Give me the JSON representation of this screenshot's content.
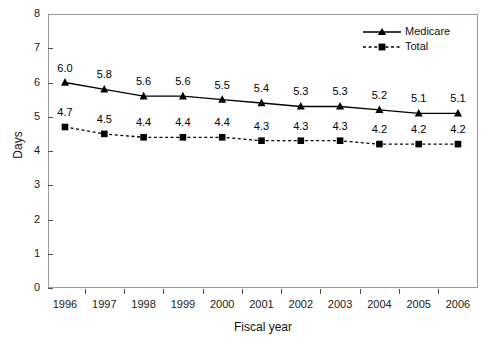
{
  "chart_data": {
    "type": "line",
    "title": "",
    "subtitle": "",
    "xlabel": "Fiscal year",
    "ylabel": "Days",
    "categories": [
      "1996",
      "1997",
      "1998",
      "1999",
      "2000",
      "2001",
      "2002",
      "2003",
      "2004",
      "2005",
      "2006"
    ],
    "x": [
      1996,
      1997,
      1998,
      1999,
      2000,
      2001,
      2002,
      2003,
      2004,
      2005,
      2006
    ],
    "ylim": [
      0,
      8
    ],
    "yticks": [
      "0",
      "1",
      "2",
      "3",
      "4",
      "5",
      "6",
      "7",
      "8"
    ],
    "grid": false,
    "legend_position": "top-right",
    "series": [
      {
        "name": "Medicare",
        "marker": "triangle",
        "linestyle": "solid",
        "color": "#000000",
        "values": [
          6.0,
          5.8,
          5.6,
          5.6,
          5.5,
          5.4,
          5.3,
          5.3,
          5.2,
          5.1,
          5.1
        ],
        "labels": [
          "6.0",
          "5.8",
          "5.6",
          "5.6",
          "5.5",
          "5.4",
          "5.3",
          "5.3",
          "5.2",
          "5.1",
          "5.1"
        ]
      },
      {
        "name": "Total",
        "marker": "square",
        "linestyle": "dashed",
        "color": "#000000",
        "values": [
          4.7,
          4.5,
          4.4,
          4.4,
          4.4,
          4.3,
          4.3,
          4.3,
          4.2,
          4.2,
          4.2
        ],
        "labels": [
          "4.7",
          "4.5",
          "4.4",
          "4.4",
          "4.4",
          "4.3",
          "4.3",
          "4.3",
          "4.2",
          "4.2",
          "4.2"
        ]
      }
    ]
  },
  "legend": {
    "items": [
      {
        "label": "Medicare"
      },
      {
        "label": "Total"
      }
    ]
  },
  "axes": {
    "y_title": "Days",
    "x_title": "Fiscal year"
  },
  "colors": {
    "series": "#000000",
    "frame": "#9a9a9a",
    "text": "#000000"
  }
}
